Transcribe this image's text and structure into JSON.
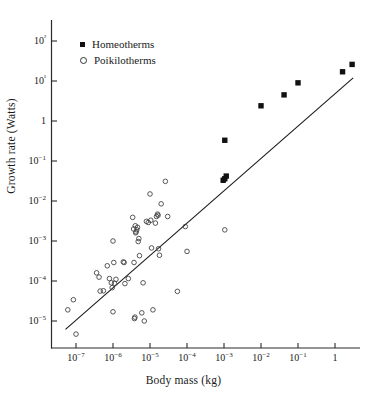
{
  "chart_data": {
    "type": "scatter",
    "title": "",
    "xlabel": "Body mass (kg)",
    "ylabel": "Growth rate (Watts)",
    "xscale": "log",
    "yscale": "log",
    "xlim": [
      2e-08,
      6.0
    ],
    "ylim": [
      1e-06,
      600.0
    ],
    "grid": false,
    "legend_position": "top-left",
    "xticks": [
      1e-07,
      1e-06,
      1e-05,
      0.0001,
      0.001,
      0.01,
      0.1,
      1
    ],
    "xtick_labels": [
      "10−7",
      "10−6",
      "10−5",
      "10−4",
      "10−3",
      "10−2",
      "10−1",
      "1"
    ],
    "yticks": [
      1e-05,
      0.0001,
      0.001,
      0.01,
      0.1,
      1,
      10,
      100
    ],
    "ytick_labels": [
      "10−5",
      "10−4",
      "10−3",
      "10−2",
      "10−1",
      "1",
      "10¹",
      "10²"
    ],
    "series": [
      {
        "name": "Homeotherms",
        "marker": "filled-square",
        "color": "#111111",
        "points": [
          [
            0.00095,
            0.033
          ],
          [
            0.00105,
            0.036
          ],
          [
            0.00115,
            0.042
          ],
          [
            0.00105,
            0.33
          ],
          [
            0.01,
            2.4
          ],
          [
            0.042,
            4.5
          ],
          [
            0.1,
            9.0
          ],
          [
            1.6,
            17.0
          ],
          [
            2.9,
            26.0
          ]
        ]
      },
      {
        "name": "Poikilotherms",
        "marker": "open-circle",
        "color": "#444444",
        "points": [
          [
            6e-08,
            1.9e-05
          ],
          [
            8.5e-08,
            3.4e-05
          ],
          [
            1e-07,
            4.7e-06
          ],
          [
            3.6e-07,
            0.00016
          ],
          [
            4.2e-07,
            0.000125
          ],
          [
            4.5e-07,
            5.6e-05
          ],
          [
            5.5e-07,
            5.7e-05
          ],
          [
            7e-07,
            0.00024
          ],
          [
            8e-07,
            0.000115
          ],
          [
            9e-07,
            9e-05
          ],
          [
            9.5e-07,
            6.8e-05
          ],
          [
            1e-06,
            0.001
          ],
          [
            1e-06,
            1.7e-05
          ],
          [
            1.05e-06,
            0.00029
          ],
          [
            1.1e-06,
            8.8e-05
          ],
          [
            1.2e-06,
            0.00011
          ],
          [
            1.9e-06,
            0.0003
          ],
          [
            2e-06,
            0.00029
          ],
          [
            2.1e-06,
            8.6e-05
          ],
          [
            2.6e-06,
            0.000115
          ],
          [
            3.4e-06,
            0.0039
          ],
          [
            3.6e-06,
            0.002
          ],
          [
            3.7e-06,
            0.00029
          ],
          [
            3.8e-06,
            1.15e-05
          ],
          [
            3.9e-06,
            1.25e-05
          ],
          [
            4e-06,
            0.0024
          ],
          [
            4.1e-06,
            0.0016
          ],
          [
            4.2e-06,
            0.0017
          ],
          [
            4.4e-06,
            0.0019
          ],
          [
            4.6e-06,
            0.0022
          ],
          [
            4.8e-06,
            0.00097
          ],
          [
            5e-06,
            0.00115
          ],
          [
            5.2e-06,
            0.00043
          ],
          [
            6e-06,
            1.6e-05
          ],
          [
            6.5e-06,
            9e-05
          ],
          [
            7e-06,
            1e-05
          ],
          [
            8e-06,
            0.0031
          ],
          [
            9e-06,
            0.0029
          ],
          [
            1e-05,
            0.015
          ],
          [
            1.05e-05,
            0.0033
          ],
          [
            1.1e-05,
            0.00067
          ],
          [
            1.2e-05,
            1.9e-05
          ],
          [
            1.4e-05,
            0.0028
          ],
          [
            1.5e-05,
            0.0041
          ],
          [
            1.6e-05,
            0.0047
          ],
          [
            1.65e-05,
            0.0044
          ],
          [
            1.7e-05,
            0.00064
          ],
          [
            1.8e-05,
            0.00044
          ],
          [
            2e-05,
            0.0085
          ],
          [
            2.6e-05,
            0.031
          ],
          [
            3e-05,
            0.0041
          ],
          [
            5.5e-05,
            5.5e-05
          ],
          [
            9e-05,
            0.0023
          ],
          [
            0.0001,
            0.00055
          ],
          [
            0.00105,
            0.0019
          ]
        ]
      }
    ],
    "fit_line": {
      "name": "regression-line",
      "x_start": 5.2e-08,
      "y_start": 6.2e-06,
      "x_end": 3.1,
      "y_end": 12.0
    }
  },
  "legend": {
    "entries": [
      {
        "label": "Homeotherms",
        "marker": "filled-square"
      },
      {
        "label": "Poikilotherms",
        "marker": "open-circle"
      }
    ]
  },
  "axes": {
    "x_title": "Body mass (kg)",
    "y_title": "Growth rate (Watts)"
  }
}
